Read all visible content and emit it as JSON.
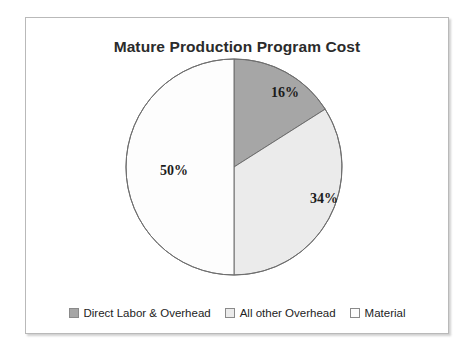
{
  "frame": {
    "border_color": "#b9b9b9",
    "background": "#ffffff"
  },
  "chart_data": {
    "type": "pie",
    "title": "Mature Production Program Cost",
    "xlabel": "",
    "ylabel": "",
    "legend_position": "bottom",
    "grid": false,
    "start_angle_oclock": 12,
    "direction": "clockwise",
    "categories": [
      "Direct Labor & Overhead",
      "All other Overhead",
      "Material"
    ],
    "values": [
      16,
      34,
      50
    ],
    "value_labels": [
      "16%",
      "34%",
      "50%"
    ],
    "colors": [
      "#a6a6a6",
      "#ebebeb",
      "#fdfdfd"
    ],
    "slice_outline_color": "#6e6e6e",
    "slices": [
      {
        "label": "Direct Labor & Overhead",
        "value": 16,
        "value_label": "16%",
        "color": "#a6a6a6"
      },
      {
        "label": "All other Overhead",
        "value": 34,
        "value_label": "34%",
        "color": "#ebebeb"
      },
      {
        "label": "Material",
        "value": 50,
        "value_label": "50%",
        "color": "#fdfdfd"
      }
    ]
  },
  "legend": {
    "items": [
      {
        "label": "Direct Labor & Overhead",
        "color": "#a6a6a6"
      },
      {
        "label": "All other Overhead",
        "color": "#ebebeb"
      },
      {
        "label": "Material",
        "color": "#fdfdfd"
      }
    ]
  }
}
